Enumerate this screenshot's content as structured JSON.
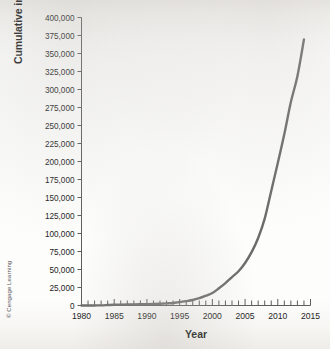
{
  "figure": {
    "credit": "© Cengage Learning"
  },
  "chart_data": {
    "type": "line",
    "title": "",
    "xlabel": "Year",
    "ylabel": "Cumulative installed capacity",
    "xlim": [
      1980,
      2015
    ],
    "ylim": [
      0,
      400000
    ],
    "grid": false,
    "legend": false,
    "x_major_ticks": [
      1980,
      1985,
      1990,
      1995,
      2000,
      2005,
      2010,
      2015
    ],
    "x_major_tick_labels": [
      "1980",
      "1985",
      "1990",
      "1995",
      "2000",
      "2005",
      "2010",
      "2015"
    ],
    "x_minor_tick_interval": 1,
    "y_ticks": [
      0,
      25000,
      50000,
      75000,
      100000,
      125000,
      150000,
      175000,
      200000,
      225000,
      250000,
      275000,
      300000,
      325000,
      350000,
      375000,
      400000
    ],
    "y_tick_labels": [
      "0",
      "25,000",
      "50,000",
      "75,000",
      "100,000",
      "125,000",
      "150,000",
      "175,000",
      "200,000",
      "225,000",
      "250,000",
      "275,000",
      "300,000",
      "325,000",
      "350,000",
      "375,000",
      "400,000"
    ],
    "line_color": "#6b6b6b",
    "series": [
      {
        "name": "Cumulative installed capacity",
        "x": [
          1980,
          1981,
          1982,
          1983,
          1984,
          1985,
          1986,
          1987,
          1988,
          1989,
          1990,
          1991,
          1992,
          1993,
          1994,
          1995,
          1996,
          1997,
          1998,
          1999,
          2000,
          2001,
          2002,
          2003,
          2004,
          2005,
          2006,
          2007,
          2008,
          2009,
          2010,
          2011,
          2012,
          2013,
          2014
        ],
        "values": [
          10,
          30,
          90,
          200,
          600,
          1020,
          1270,
          1450,
          1580,
          1730,
          1930,
          2170,
          2510,
          2990,
          3490,
          4780,
          6100,
          7600,
          10200,
          13600,
          17400,
          23900,
          31100,
          39431,
          47620,
          59091,
          74052,
          93820,
          120690,
          159050,
          197940,
          238110,
          282590,
          318530,
          369600
        ]
      }
    ]
  }
}
